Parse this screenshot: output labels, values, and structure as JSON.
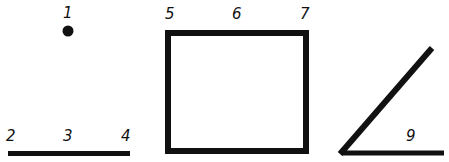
{
  "figures": {
    "point": {
      "labels": [
        "1"
      ],
      "color": "#111111"
    },
    "line_segment": {
      "labels": [
        "2",
        "3",
        "4"
      ],
      "color": "#111111"
    },
    "square": {
      "labels": [
        "5",
        "6",
        "7"
      ],
      "color": "#111111"
    },
    "angle": {
      "labels": [
        "9"
      ],
      "color": "#111111"
    }
  }
}
